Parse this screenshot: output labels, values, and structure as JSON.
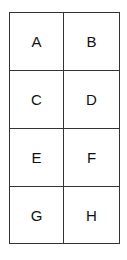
{
  "grid": {
    "rows": 4,
    "columns": 2,
    "cells": [
      {
        "label": "A"
      },
      {
        "label": "B"
      },
      {
        "label": "C"
      },
      {
        "label": "D"
      },
      {
        "label": "E"
      },
      {
        "label": "F"
      },
      {
        "label": "G"
      },
      {
        "label": "H"
      }
    ],
    "line_color": "#333333"
  }
}
